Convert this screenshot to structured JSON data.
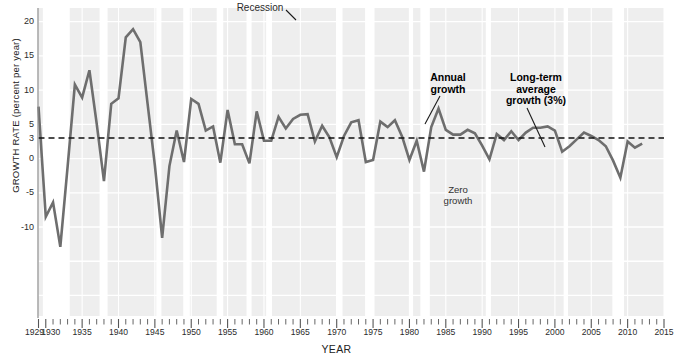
{
  "chart_data": {
    "type": "line",
    "title": "",
    "xlabel": "YEAR",
    "ylabel": "GROWTH RATE (percent per year)",
    "xlim": [
      1929,
      2015
    ],
    "ylim": [
      -23,
      22
    ],
    "yticks": [
      20,
      15,
      10,
      5,
      3,
      0,
      -5,
      -10
    ],
    "ytick_labels": [
      "20",
      "15",
      "10",
      "5",
      "3",
      "0",
      "-5",
      "-10"
    ],
    "xticks": [
      1929,
      1930,
      1935,
      1940,
      1945,
      1950,
      1955,
      1960,
      1965,
      1970,
      1975,
      1980,
      1985,
      1990,
      1995,
      2000,
      2005,
      2010,
      2015
    ],
    "xtick_labels": [
      "1929",
      "1930",
      "1935",
      "1940",
      "1945",
      "1950",
      "1955",
      "1960",
      "1965",
      "1970",
      "1975",
      "1980",
      "1985",
      "1990",
      "1995",
      "2000",
      "2005",
      "2010",
      "2015"
    ],
    "grid": true,
    "legend": "none",
    "series": [
      {
        "name": "Annual growth",
        "color": "#6e6e6e",
        "x": [
          1929,
          1930,
          1931,
          1932,
          1933,
          1934,
          1935,
          1936,
          1937,
          1938,
          1939,
          1940,
          1941,
          1942,
          1943,
          1944,
          1945,
          1946,
          1947,
          1948,
          1949,
          1950,
          1951,
          1952,
          1953,
          1954,
          1955,
          1956,
          1957,
          1958,
          1959,
          1960,
          1961,
          1962,
          1963,
          1964,
          1965,
          1966,
          1967,
          1968,
          1969,
          1970,
          1971,
          1972,
          1973,
          1974,
          1975,
          1976,
          1977,
          1978,
          1979,
          1980,
          1981,
          1982,
          1983,
          1984,
          1985,
          1986,
          1987,
          1988,
          1989,
          1990,
          1991,
          1992,
          1993,
          1994,
          1995,
          1996,
          1997,
          1998,
          1999,
          2000,
          2001,
          2002,
          2003,
          2004,
          2005,
          2006,
          2007,
          2008,
          2009,
          2010,
          2011,
          2012
        ],
        "y": [
          7.6,
          -8.5,
          -6.4,
          -12.9,
          -1.2,
          10.8,
          8.9,
          12.9,
          5.1,
          -3.3,
          8.0,
          8.8,
          17.7,
          18.9,
          17.0,
          8.0,
          -1.0,
          -11.6,
          -1.1,
          4.1,
          -0.5,
          8.7,
          8.0,
          4.1,
          4.7,
          -0.6,
          7.1,
          2.1,
          2.1,
          -0.7,
          6.9,
          2.6,
          2.6,
          6.1,
          4.4,
          5.8,
          6.4,
          6.5,
          2.5,
          4.8,
          3.1,
          0.2,
          3.3,
          5.3,
          5.6,
          -0.5,
          -0.2,
          5.4,
          4.6,
          5.6,
          3.2,
          -0.2,
          2.6,
          -1.9,
          4.6,
          7.3,
          4.2,
          3.5,
          3.5,
          4.2,
          3.7,
          1.9,
          -0.1,
          3.6,
          2.7,
          4.0,
          2.7,
          3.8,
          4.5,
          4.5,
          4.7,
          4.1,
          1.0,
          1.8,
          2.8,
          3.8,
          3.3,
          2.7,
          1.8,
          -0.3,
          -2.8,
          2.5,
          1.6,
          2.2
        ]
      }
    ],
    "reference_lines": [
      {
        "name": "Long-term average growth (3%)",
        "value": 3,
        "style": "dashed"
      },
      {
        "name": "Zero growth",
        "value": 0,
        "style": "gridline"
      }
    ],
    "recession_bands": [
      {
        "start": 1929.6,
        "end": 1933.3
      },
      {
        "start": 1937.4,
        "end": 1938.5
      },
      {
        "start": 1945.2,
        "end": 1945.9
      },
      {
        "start": 1948.9,
        "end": 1949.8
      },
      {
        "start": 1953.5,
        "end": 1954.4
      },
      {
        "start": 1957.6,
        "end": 1958.3
      },
      {
        "start": 1960.3,
        "end": 1961.1
      },
      {
        "start": 1969.9,
        "end": 1970.8
      },
      {
        "start": 1973.9,
        "end": 1975.2
      },
      {
        "start": 1980.0,
        "end": 1980.5
      },
      {
        "start": 1981.5,
        "end": 1982.8
      },
      {
        "start": 1990.5,
        "end": 1991.2
      },
      {
        "start": 2001.2,
        "end": 2001.8
      },
      {
        "start": 2007.9,
        "end": 2009.5
      }
    ],
    "annotations": [
      {
        "name": "recession",
        "text": "Recession",
        "bold": false
      },
      {
        "name": "annual-growth",
        "text_line1": "Annual",
        "text_line2": "growth",
        "bold": true
      },
      {
        "name": "long-term-average",
        "text_line1": "Long-term",
        "text_line2": "average",
        "text_line3": "growth (3%)",
        "bold": true
      },
      {
        "name": "zero-growth",
        "text_line1": "Zero",
        "text_line2": "growth",
        "bold": false
      }
    ],
    "colors": {
      "plot_background": "#eeeeee",
      "recession_band": "#ffffff",
      "gridline": "#ffffff",
      "line": "#6e6e6e",
      "dashed_reference": "#111111",
      "text": "#2b2b2b"
    }
  }
}
